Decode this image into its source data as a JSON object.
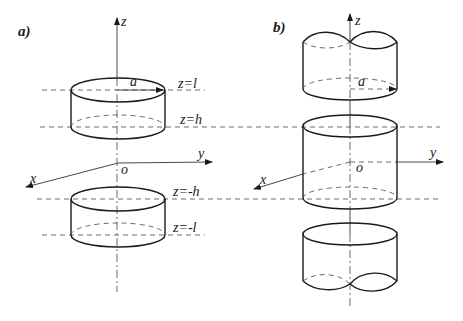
{
  "panels": {
    "a": {
      "label": "a)",
      "axes": {
        "z": "z",
        "y": "y",
        "x": "x",
        "origin": "o"
      },
      "radius_label": "a",
      "planes": [
        {
          "id": "z_l",
          "label": "z=l"
        },
        {
          "id": "z_h",
          "label": "z=h"
        },
        {
          "id": "z_neg_h",
          "label": "z=-h"
        },
        {
          "id": "z_neg_l",
          "label": "z=-l"
        }
      ],
      "description": "Two finite coaxial cylinders of radius a occupying h<|z|<l"
    },
    "b": {
      "label": "b)",
      "axes": {
        "z": "z",
        "y": "y",
        "x": "x",
        "origin": "o"
      },
      "radius_label": "a",
      "description": "Central cylinder between z=-h and z=h plus two semi-infinite cylinders (wavy broken ends) beyond"
    }
  }
}
